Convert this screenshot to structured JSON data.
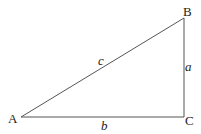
{
  "diagram": {
    "type": "right-triangle",
    "vertices": {
      "A": {
        "label": "A",
        "x": 21,
        "y": 117
      },
      "B": {
        "label": "B",
        "x": 184,
        "y": 18
      },
      "C": {
        "label": "C",
        "x": 184,
        "y": 117
      }
    },
    "sides": {
      "a": {
        "label": "a",
        "from": "B",
        "to": "C"
      },
      "b": {
        "label": "b",
        "from": "A",
        "to": "C"
      },
      "c": {
        "label": "c",
        "from": "A",
        "to": "B"
      }
    },
    "line_color": "#555555",
    "text_color": "#222222"
  }
}
